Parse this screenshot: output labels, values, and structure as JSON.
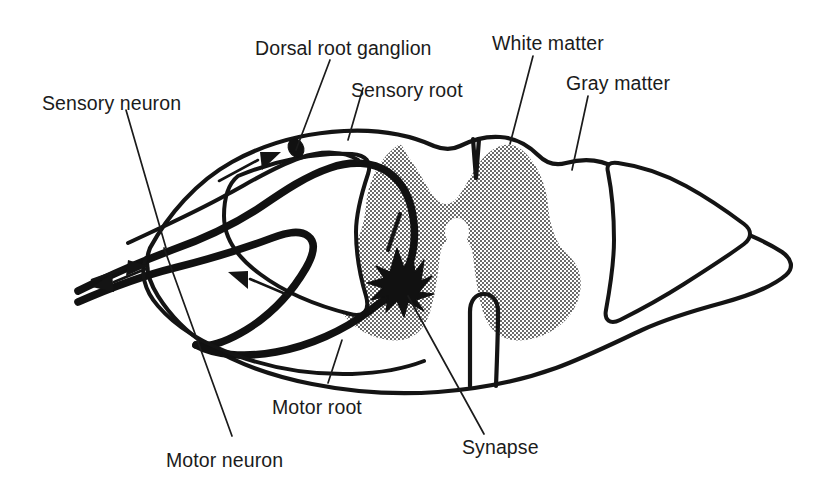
{
  "figure": {
    "background_color": "#ffffff",
    "ink_color": "#141414",
    "gray_matter_fill": "#b9b9b9"
  },
  "labels": {
    "sensory_neuron": "Sensory neuron",
    "dorsal_root_ganglion": "Dorsal root ganglion",
    "sensory_root": "Sensory root",
    "white_matter": "White matter",
    "gray_matter": "Gray matter",
    "motor_root": "Motor root",
    "motor_neuron": "Motor neuron",
    "synapse": "Synapse"
  },
  "structures": [
    {
      "name": "spinal-cord-outline",
      "description": "Outer boundary of spinal cord cross-section"
    },
    {
      "name": "gray-matter-butterfly",
      "description": "Stippled butterfly-shaped gray matter"
    },
    {
      "name": "central-canal",
      "description": "Small oval opening at center of gray matter"
    },
    {
      "name": "dorsal-median-sulcus",
      "description": "V-shaped notch at top midline"
    },
    {
      "name": "ventral-median-fissure",
      "description": "U-shaped cleft at bottom midline"
    },
    {
      "name": "dorsal-root-ganglion",
      "description": "Dark oval swelling on the sensory root"
    },
    {
      "name": "sensory-root-fiber",
      "description": "Thick afferent fiber entering dorsally"
    },
    {
      "name": "motor-root-fiber",
      "description": "Thick efferent fiber exiting ventrally"
    },
    {
      "name": "synapse-cell-body",
      "description": "Star-shaped multipolar motor neuron cell body"
    },
    {
      "name": "peripheral-nerve-left",
      "description": "Mixed spinal nerve at left"
    },
    {
      "name": "nerve-root-right",
      "description": "Wedge-shaped nerve root contour at right"
    }
  ],
  "flow_arrows": [
    {
      "name": "afferent-inbound-arrow",
      "direction": "toward cord",
      "located": "left peripheral nerve upper branch"
    },
    {
      "name": "afferent-ascending-arrow",
      "direction": "toward dorsal root",
      "located": "upper left inside cord"
    },
    {
      "name": "efferent-outbound-arrow",
      "direction": "away from cord",
      "located": "left peripheral nerve lower branch"
    },
    {
      "name": "efferent-descending-arrow",
      "direction": "toward periphery",
      "located": "lower left inside cord"
    }
  ]
}
